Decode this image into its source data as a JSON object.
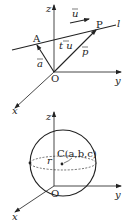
{
  "figure_top": {
    "description": "Vector equation of a line in 3D space",
    "axes": {
      "x": "x",
      "y": "y",
      "z": "z"
    },
    "origin": "O",
    "line_label": "l",
    "points": {
      "A": "A",
      "P": "P"
    },
    "vectors": {
      "a": "a",
      "p": "p",
      "u": "u",
      "tu": "t u"
    }
  },
  "figure_bottom": {
    "description": "Sphere with center C(a,b,c) and radius r",
    "axes": {
      "x": "x",
      "y": "y",
      "z": "z"
    },
    "origin": "O",
    "center_label": "C(a,b,c)",
    "radius_label": "r"
  },
  "colors": {
    "stroke": "#222222",
    "background": "#ffffff"
  }
}
